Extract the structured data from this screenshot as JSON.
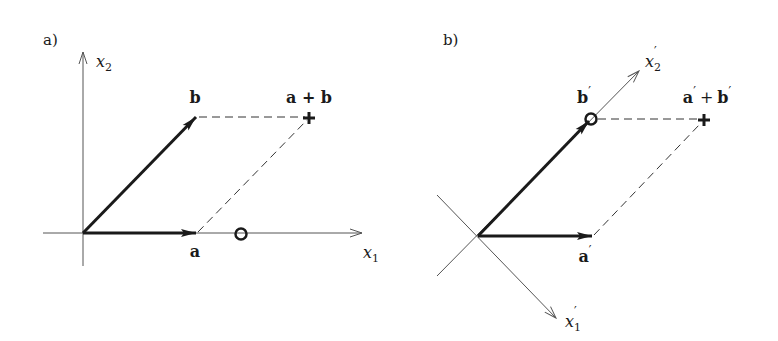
{
  "figure": {
    "colors": {
      "ink": "#1a1a1a",
      "axis": "#555555",
      "background": "#ffffff"
    }
  },
  "panels": [
    {
      "id": "a",
      "panel_label": "a)",
      "axes": {
        "x1": {
          "label_base": "x",
          "label_sub": "1"
        },
        "x2": {
          "label_base": "x",
          "label_sub": "2"
        }
      },
      "vectors": [
        {
          "name": "a",
          "label": "a"
        },
        {
          "name": "b",
          "label": "b"
        }
      ],
      "sum_label": "a + b",
      "sum_marker": "plus",
      "extra_marker": "circle on x1 axis"
    },
    {
      "id": "b",
      "panel_label": "b)",
      "axes": {
        "x1": {
          "label_base": "x",
          "label_sub": "1",
          "prime": "′"
        },
        "x2": {
          "label_base": "x",
          "label_sub": "2",
          "prime": "′"
        }
      },
      "vectors": [
        {
          "name": "a'",
          "label": "a",
          "prime": "′"
        },
        {
          "name": "b'",
          "label": "b",
          "prime": "′"
        }
      ],
      "sum_label": {
        "a": "a",
        "plus": "+",
        "b": "b",
        "prime": "′"
      },
      "sum_marker": "plus",
      "extra_marker": "circle at tip of b′ on x2′ axis"
    }
  ]
}
